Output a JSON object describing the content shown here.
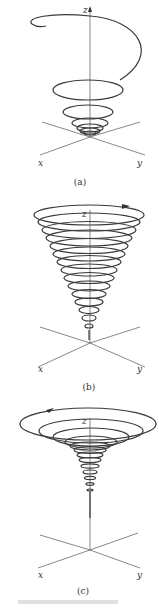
{
  "figure": {
    "panels": [
      {
        "id": "a",
        "caption": "(a)",
        "axes": {
          "x": "x",
          "y": "y",
          "z": "z"
        },
        "description": "helix spiraling outward as it rises; tight coils at origin"
      },
      {
        "id": "b",
        "caption": "(b)",
        "axes": {
          "x": "x",
          "y": "y",
          "z": "z"
        },
        "description": "conical helix with evenly spaced coils widening upward"
      },
      {
        "id": "c",
        "caption": "(c)",
        "axes": {
          "x": "x",
          "y": "y",
          "z": "z"
        },
        "description": "funnel-shaped helix with coils flaring sharply near top"
      }
    ],
    "footer_text": "FIGURE"
  },
  "colors": {
    "curve": "#3a3a3a",
    "axes": "#555555",
    "background": "#ffffff"
  }
}
